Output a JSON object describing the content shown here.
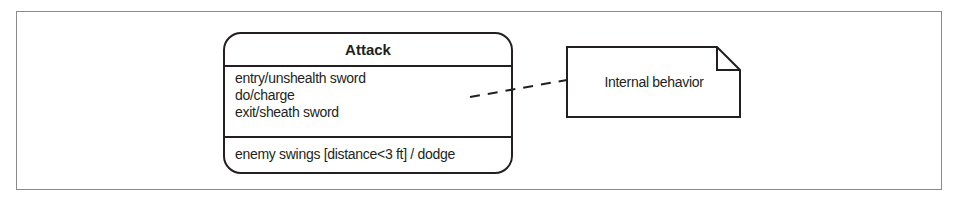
{
  "diagram": {
    "type": "UML state diagram",
    "state": {
      "name": "Attack",
      "internal_activities": [
        "entry/unshealth sword",
        "do/charge",
        "exit/sheath sword"
      ],
      "internal_transition": "enemy swings [distance<3 ft] / dodge"
    },
    "note": {
      "text": "Internal behavior",
      "attached_to": "internal activities compartment",
      "connector": "dashed line"
    },
    "colors": {
      "stroke": "#231f20",
      "frame": "#8a8a8a",
      "background": "#ffffff"
    }
  }
}
